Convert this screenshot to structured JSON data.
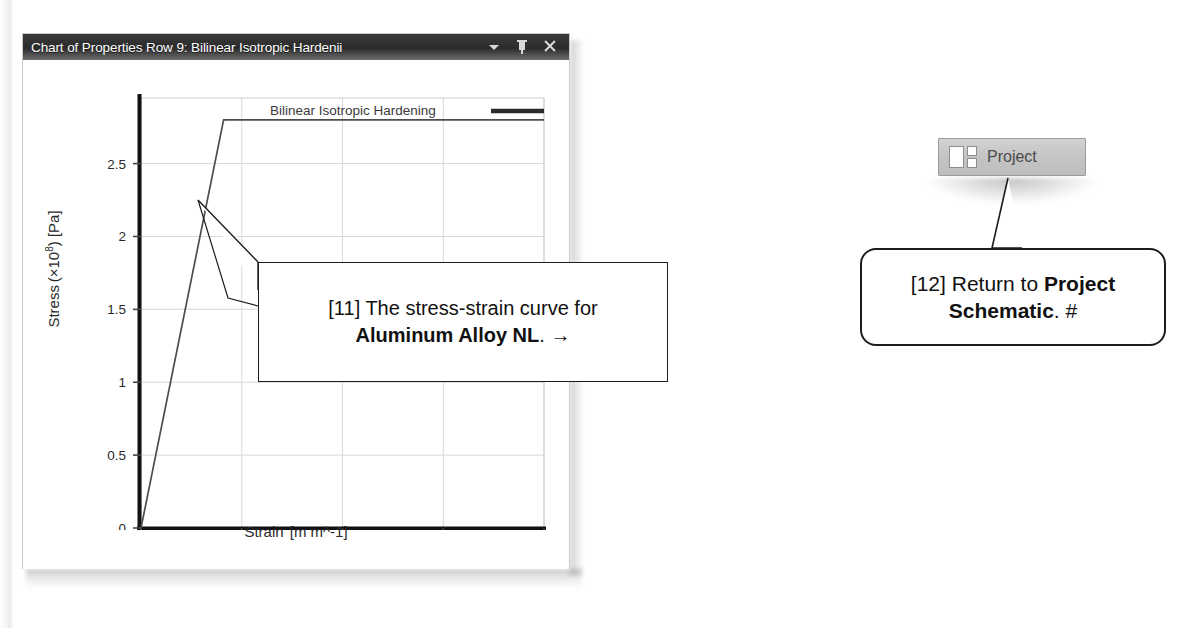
{
  "panel": {
    "title": "Chart of Properties Row 9: Bilinear Isotropic Hardenii",
    "buttons": {
      "dropdown": "dropdown-caret",
      "pin": "pin",
      "close": "close"
    }
  },
  "chart_data": {
    "type": "line",
    "title": "",
    "xlabel_prefix": "Strain",
    "xlabel_unit": "[m m^-1]",
    "ylabel_prefix": "Stress",
    "ylabel_scale": "(×10",
    "ylabel_exp": "8",
    "ylabel_unit": ") [Pa]",
    "xlim": [
      0,
      0.02
    ],
    "ylim": [
      0,
      2.95
    ],
    "xticks": [
      0,
      0.005,
      0.01,
      0.015,
      0.02
    ],
    "xticklabels": [
      "0",
      "0.005",
      "0.01",
      "0.015",
      "0.02"
    ],
    "yticks": [
      0,
      0.5,
      1,
      1.5,
      2,
      2.5
    ],
    "yticklabels": [
      "0",
      "0.5",
      "1",
      "1.5",
      "2",
      "2.5"
    ],
    "grid": true,
    "legend": {
      "label": "Bilinear Isotropic Hardening",
      "position": "top-center"
    },
    "series": [
      {
        "name": "Bilinear Isotropic Hardening",
        "x": [
          0,
          0.0041,
          0.02
        ],
        "y": [
          0,
          2.8,
          2.8
        ],
        "color": "#4d4d4d"
      }
    ],
    "annotation_anchor": {
      "x": 0.0025,
      "y": 2.0
    }
  },
  "callouts": {
    "c11": {
      "tag": "[11]",
      "text_before": " The stress-strain curve for",
      "bold": "Aluminum Alloy NL",
      "text_after": ". →"
    },
    "c12": {
      "tag": "[12]",
      "text_before": " Return to ",
      "bold1": "Project",
      "bold2": "Schematic",
      "text_after": ". #"
    }
  },
  "project_button": {
    "label": "Project",
    "icon": "layout-panes-icon"
  }
}
